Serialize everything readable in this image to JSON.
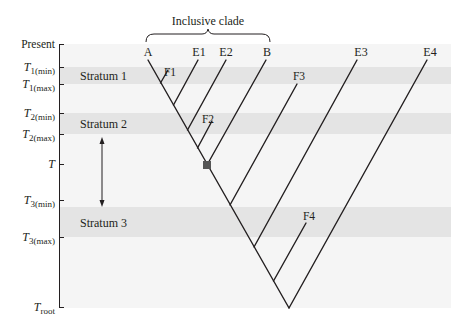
{
  "figure": {
    "title": "Inclusive clade",
    "axis": {
      "ticks": [
        {
          "id": "present",
          "main": "Present",
          "sub": "",
          "y": 44
        },
        {
          "id": "t1min",
          "main": "T",
          "sub": "1(min)",
          "y": 67
        },
        {
          "id": "t1max",
          "main": "T",
          "sub": "1(max)",
          "y": 84
        },
        {
          "id": "t2min",
          "main": "T",
          "sub": "2(min)",
          "y": 113
        },
        {
          "id": "t2max",
          "main": "T",
          "sub": "2(max)",
          "y": 134
        },
        {
          "id": "t",
          "main": "T",
          "sub": "",
          "y": 164
        },
        {
          "id": "t3min",
          "main": "T",
          "sub": "3(min)",
          "y": 200
        },
        {
          "id": "t3max",
          "main": "T",
          "sub": "3(max)",
          "y": 237
        },
        {
          "id": "troot",
          "main": "T",
          "sub": "root",
          "y": 308
        }
      ]
    },
    "strata": [
      {
        "label": "Stratum 1",
        "y_top": 67,
        "y_bottom": 84
      },
      {
        "label": "Stratum 2",
        "y_top": 113,
        "y_bottom": 134
      },
      {
        "label": "Stratum 3",
        "y_top": 207,
        "y_bottom": 237
      }
    ],
    "taxa": {
      "A": "A",
      "E1": "E1",
      "E2": "E2",
      "B": "B",
      "E3": "E3",
      "E4": "E4",
      "F1": "F1",
      "F2": "F2",
      "F3": "F3",
      "F4": "F4"
    },
    "colors": {
      "plot_bg": "#f5f5f5",
      "stratum_bg": "#e4e4e4",
      "line": "#231f20",
      "node": "#555555"
    }
  }
}
